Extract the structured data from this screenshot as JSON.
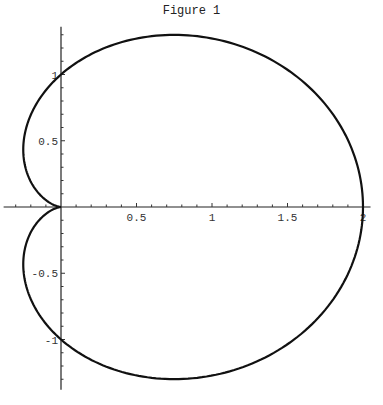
{
  "chart_data": {
    "type": "line",
    "title": "Figure 1",
    "xlabel": "",
    "ylabel": "",
    "curve": "cardioid r = 1 + cos(theta)",
    "xlim": [
      -0.38,
      2.05
    ],
    "ylim": [
      -1.38,
      1.36
    ],
    "xticks": [
      0.5,
      1,
      1.5,
      2
    ],
    "xtick_labels": [
      "0.5",
      "1",
      "1.5",
      "2"
    ],
    "yticks": [
      1,
      0.5,
      -0.5,
      -1
    ],
    "ytick_labels": [
      "1",
      "0.5",
      "-0.5",
      "-1"
    ],
    "minor_tick_step": 0.1,
    "grid": false,
    "legend": "none",
    "series": [
      {
        "name": "cardioid",
        "param": "theta",
        "theta_range": [
          0,
          6.2832
        ],
        "samples": 360,
        "x_expr": "(1+cos(t))*cos(t)",
        "y_expr": "(1+cos(t))*sin(t)"
      }
    ],
    "sample_points": [
      {
        "x": 2,
        "y": 0
      },
      {
        "x": 0.75,
        "y": 1.299
      },
      {
        "x": 0,
        "y": 1
      },
      {
        "x": -0.25,
        "y": 0.433
      },
      {
        "x": 0,
        "y": 0
      },
      {
        "x": -0.25,
        "y": -0.433
      },
      {
        "x": 0,
        "y": -1
      },
      {
        "x": 0.75,
        "y": -1.299
      }
    ]
  }
}
